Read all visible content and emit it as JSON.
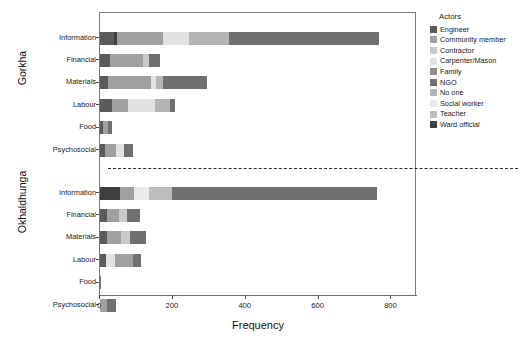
{
  "chart_data": {
    "type": "bar",
    "orientation": "horizontal",
    "stacked": true,
    "title": "",
    "xlabel": "Frequency",
    "ylabel": "",
    "xlim": [
      0,
      870
    ],
    "xticks": [
      0,
      200,
      400,
      600,
      800
    ],
    "xticklabels": [
      "0",
      "200",
      "400",
      "600",
      "800"
    ],
    "grid": false,
    "legend": {
      "title": "Actors",
      "position": "right",
      "entries": [
        {
          "name": "Engineer",
          "color": "#5b5b5b"
        },
        {
          "name": "Community member",
          "color": "#a0a0a0"
        },
        {
          "name": "Contractor",
          "color": "#c9c9c9"
        },
        {
          "name": "Carpenter/Mason",
          "color": "#e2e2e2"
        },
        {
          "name": "Family",
          "color": "#8d8d8d"
        },
        {
          "name": "NGO",
          "color": "#707070"
        },
        {
          "name": "No one",
          "color": "#b5b5b5"
        },
        {
          "name": "Social worker",
          "color": "#eaeaea"
        },
        {
          "name": "Teacher",
          "color": "#bdbdbd"
        },
        {
          "name": "Ward official",
          "color": "#3f3f3f"
        }
      ]
    },
    "facets": [
      {
        "name": "Gorkha",
        "categories": [
          "Information",
          "Financial",
          "Materials",
          "Labour",
          "Food",
          "Psychosocial"
        ],
        "bars": [
          {
            "category": "Information",
            "total": 765,
            "segments": [
              {
                "actor": "Engineer",
                "value": 38,
                "color": "#5b5b5b"
              },
              {
                "actor": "Ward official",
                "value": 10,
                "color": "#3f3f3f"
              },
              {
                "actor": "Community member",
                "value": 125,
                "color": "#a0a0a0"
              },
              {
                "actor": "Carpenter/Mason",
                "value": 70,
                "color": "#e2e2e2"
              },
              {
                "actor": "No one",
                "value": 112,
                "color": "#b5b5b5"
              },
              {
                "actor": "NGO",
                "value": 410,
                "color": "#707070"
              }
            ]
          },
          {
            "category": "Financial",
            "total": 165,
            "segments": [
              {
                "actor": "Engineer",
                "value": 28,
                "color": "#5b5b5b"
              },
              {
                "actor": "Community member",
                "value": 90,
                "color": "#a0a0a0"
              },
              {
                "actor": "Contractor",
                "value": 16,
                "color": "#c9c9c9"
              },
              {
                "actor": "NGO",
                "value": 31,
                "color": "#707070"
              }
            ]
          },
          {
            "category": "Materials",
            "total": 295,
            "segments": [
              {
                "actor": "Engineer",
                "value": 22,
                "color": "#5b5b5b"
              },
              {
                "actor": "Community member",
                "value": 118,
                "color": "#a0a0a0"
              },
              {
                "actor": "Carpenter/Mason",
                "value": 14,
                "color": "#e2e2e2"
              },
              {
                "actor": "No one",
                "value": 20,
                "color": "#b5b5b5"
              },
              {
                "actor": "NGO",
                "value": 121,
                "color": "#707070"
              }
            ]
          },
          {
            "category": "Labour",
            "total": 205,
            "segments": [
              {
                "actor": "Engineer",
                "value": 32,
                "color": "#5b5b5b"
              },
              {
                "actor": "Community member",
                "value": 45,
                "color": "#a0a0a0"
              },
              {
                "actor": "Carpenter/Mason",
                "value": 75,
                "color": "#e2e2e2"
              },
              {
                "actor": "No one",
                "value": 40,
                "color": "#b5b5b5"
              },
              {
                "actor": "NGO",
                "value": 13,
                "color": "#707070"
              }
            ]
          },
          {
            "category": "Food",
            "total": 32,
            "segments": [
              {
                "actor": "Engineer",
                "value": 8,
                "color": "#5b5b5b"
              },
              {
                "actor": "Community member",
                "value": 14,
                "color": "#a0a0a0"
              },
              {
                "actor": "NGO",
                "value": 10,
                "color": "#707070"
              }
            ]
          },
          {
            "category": "Psychosocial",
            "total": 90,
            "segments": [
              {
                "actor": "Engineer",
                "value": 14,
                "color": "#5b5b5b"
              },
              {
                "actor": "Community member",
                "value": 30,
                "color": "#a0a0a0"
              },
              {
                "actor": "Carpenter/Mason",
                "value": 22,
                "color": "#e2e2e2"
              },
              {
                "actor": "NGO",
                "value": 24,
                "color": "#707070"
              }
            ]
          }
        ]
      },
      {
        "name": "Okhaldhunga",
        "categories": [
          "Information",
          "Financial",
          "Materials",
          "Labour",
          "Food",
          "Psychosocial"
        ],
        "bars": [
          {
            "category": "Information",
            "total": 760,
            "segments": [
              {
                "actor": "Ward official",
                "value": 55,
                "color": "#3f3f3f"
              },
              {
                "actor": "Community member",
                "value": 38,
                "color": "#a0a0a0"
              },
              {
                "actor": "Social worker",
                "value": 42,
                "color": "#eaeaea"
              },
              {
                "actor": "Teacher",
                "value": 62,
                "color": "#bdbdbd"
              },
              {
                "actor": "NGO",
                "value": 563,
                "color": "#707070"
              }
            ]
          },
          {
            "category": "Financial",
            "total": 110,
            "segments": [
              {
                "actor": "Engineer",
                "value": 18,
                "color": "#5b5b5b"
              },
              {
                "actor": "Community member",
                "value": 35,
                "color": "#a0a0a0"
              },
              {
                "actor": "Contractor",
                "value": 22,
                "color": "#c9c9c9"
              },
              {
                "actor": "NGO",
                "value": 35,
                "color": "#707070"
              }
            ]
          },
          {
            "category": "Materials",
            "total": 125,
            "segments": [
              {
                "actor": "Engineer",
                "value": 20,
                "color": "#5b5b5b"
              },
              {
                "actor": "Community member",
                "value": 38,
                "color": "#a0a0a0"
              },
              {
                "actor": "Contractor",
                "value": 24,
                "color": "#c9c9c9"
              },
              {
                "actor": "NGO",
                "value": 43,
                "color": "#707070"
              }
            ]
          },
          {
            "category": "Labour",
            "total": 112,
            "segments": [
              {
                "actor": "Engineer",
                "value": 16,
                "color": "#5b5b5b"
              },
              {
                "actor": "Carpenter/Mason",
                "value": 26,
                "color": "#e2e2e2"
              },
              {
                "actor": "Community member",
                "value": 48,
                "color": "#a0a0a0"
              },
              {
                "actor": "NGO",
                "value": 22,
                "color": "#707070"
              }
            ]
          },
          {
            "category": "Food",
            "total": 3,
            "segments": [
              {
                "actor": "NGO",
                "value": 3,
                "color": "#707070"
              }
            ]
          },
          {
            "category": "Psychosocial",
            "total": 45,
            "segments": [
              {
                "actor": "Community member",
                "value": 20,
                "color": "#a0a0a0"
              },
              {
                "actor": "NGO",
                "value": 25,
                "color": "#707070"
              }
            ]
          }
        ]
      }
    ]
  }
}
